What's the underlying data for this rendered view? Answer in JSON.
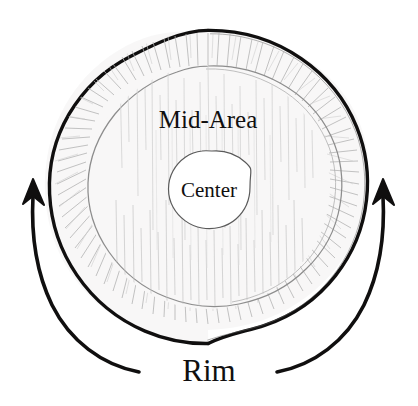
{
  "figure": {
    "kind": "hand-drawn concentric circle diagram",
    "background_color": "#ffffff",
    "ink_color": "#100f0f",
    "sketch_color": "#b9b9b9",
    "labels": {
      "outer": "Rim",
      "middle": "Mid-Area",
      "inner": "Center"
    },
    "arrows": {
      "left": {
        "name": "rotation-arrow-left",
        "direction": "up",
        "color": "#100f0f"
      },
      "right": {
        "name": "rotation-arrow-right",
        "direction": "up",
        "color": "#100f0f"
      }
    },
    "rings": [
      {
        "name": "rim-ring",
        "label": "Rim",
        "radius_px": 156,
        "stroke": "#100f0f"
      },
      {
        "name": "mid-area-ring",
        "label": "Mid-Area",
        "radius_px": 122,
        "stroke": "#8d8d8d"
      },
      {
        "name": "center-circle",
        "label": "Center",
        "radius_px": 37,
        "stroke": "#5a5a5a"
      }
    ],
    "center_point": {
      "x": 208,
      "y": 187
    }
  }
}
